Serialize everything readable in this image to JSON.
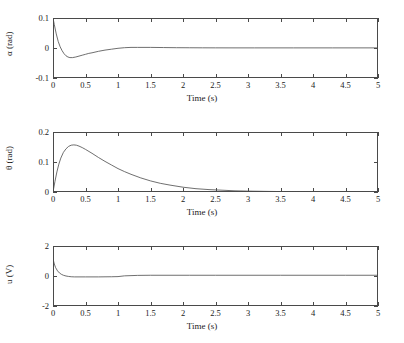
{
  "figure": {
    "background": "#ffffff",
    "line_color": "#4a4a4a",
    "axis_color": "#4a4a4a"
  },
  "chart_data": [
    {
      "type": "line",
      "name": "alpha-response",
      "title": "",
      "xlabel": "Time (s)",
      "ylabel": "α (rad)",
      "ylabel_symbol": "α",
      "ylabel_unit": "(rad)",
      "xlim": [
        0,
        5
      ],
      "ylim": [
        -0.1,
        0.1
      ],
      "xticks": [
        0,
        0.5,
        1,
        1.5,
        2,
        2.5,
        3,
        3.5,
        4,
        4.5,
        5
      ],
      "xticklabels": [
        "0",
        "0.5",
        "1",
        "1.5",
        "2",
        "2.5",
        "3",
        "3.5",
        "4",
        "4.5",
        "5"
      ],
      "yticks": [
        -0.1,
        0,
        0.1
      ],
      "yticklabels": [
        "-0.1",
        "0",
        "0.1"
      ],
      "grid": false,
      "legend": null,
      "x": [
        0,
        0.02,
        0.05,
        0.08,
        0.11,
        0.14,
        0.17,
        0.2,
        0.23,
        0.26,
        0.3,
        0.35,
        0.4,
        0.45,
        0.5,
        0.55,
        0.6,
        0.7,
        0.8,
        0.9,
        1.0,
        1.1,
        1.2,
        1.3,
        1.4,
        1.5,
        1.7,
        1.9,
        2.1,
        2.3,
        2.5,
        2.8,
        3.1,
        3.4,
        3.7,
        4.0,
        4.3,
        4.6,
        5.0
      ],
      "values": [
        0.1,
        0.078,
        0.047,
        0.022,
        0.004,
        -0.009,
        -0.019,
        -0.026,
        -0.03,
        -0.032,
        -0.032,
        -0.03,
        -0.027,
        -0.024,
        -0.021,
        -0.018,
        -0.016,
        -0.011,
        -0.007,
        -0.004,
        -0.001,
        0.001,
        0.002,
        0.002,
        0.002,
        0.002,
        0.0015,
        0.001,
        0.0008,
        0.0006,
        0.0005,
        0.0004,
        0.0004,
        0.0004,
        0.0004,
        0.0004,
        0.0004,
        0.0004,
        0.0004
      ]
    },
    {
      "type": "line",
      "name": "theta-response",
      "title": "",
      "xlabel": "Time (s)",
      "ylabel": "θ (rad)",
      "ylabel_symbol": "θ",
      "ylabel_unit": "(rad)",
      "xlim": [
        0,
        5
      ],
      "ylim": [
        0,
        0.2
      ],
      "xticks": [
        0,
        0.5,
        1,
        1.5,
        2,
        2.5,
        3,
        3.5,
        4,
        4.5,
        5
      ],
      "xticklabels": [
        "0",
        "0.5",
        "1",
        "1.5",
        "2",
        "2.5",
        "3",
        "3.5",
        "4",
        "4.5",
        "5"
      ],
      "yticks": [
        0,
        0.1,
        0.2
      ],
      "yticklabels": [
        "0",
        "0.1",
        "0.2"
      ],
      "grid": false,
      "legend": null,
      "x": [
        0,
        0.03,
        0.06,
        0.09,
        0.12,
        0.16,
        0.2,
        0.24,
        0.28,
        0.32,
        0.36,
        0.4,
        0.45,
        0.5,
        0.6,
        0.7,
        0.8,
        0.9,
        1.0,
        1.1,
        1.2,
        1.35,
        1.5,
        1.65,
        1.8,
        2.0,
        2.2,
        2.4,
        2.6,
        2.8,
        3.0,
        3.3,
        3.6,
        4.0,
        4.4,
        5.0
      ],
      "values": [
        0.0,
        0.035,
        0.067,
        0.093,
        0.113,
        0.132,
        0.144,
        0.152,
        0.156,
        0.157,
        0.156,
        0.153,
        0.148,
        0.142,
        0.129,
        0.115,
        0.102,
        0.09,
        0.078,
        0.068,
        0.059,
        0.047,
        0.037,
        0.029,
        0.023,
        0.016,
        0.011,
        0.008,
        0.006,
        0.004,
        0.003,
        0.002,
        0.0012,
        0.0007,
        0.0004,
        0.0002
      ]
    },
    {
      "type": "line",
      "name": "u-control-effort",
      "title": "",
      "xlabel": "Time (s)",
      "ylabel": "u (V)",
      "ylabel_symbol": "u",
      "ylabel_unit": "(V)",
      "xlim": [
        0,
        5
      ],
      "ylim": [
        -2,
        2
      ],
      "xticks": [
        0,
        0.5,
        1,
        1.5,
        2,
        2.5,
        3,
        3.5,
        4,
        4.5,
        5
      ],
      "xticklabels": [
        "0",
        "0.5",
        "1",
        "1.5",
        "2",
        "2.5",
        "3",
        "3.5",
        "4",
        "4.5",
        "5"
      ],
      "yticks": [
        -2,
        0,
        2
      ],
      "yticklabels": [
        "-2",
        "0",
        "2"
      ],
      "grid": false,
      "legend": null,
      "x": [
        0,
        0.02,
        0.04,
        0.07,
        0.1,
        0.13,
        0.16,
        0.2,
        0.24,
        0.28,
        0.33,
        0.4,
        0.5,
        0.6,
        0.7,
        0.8,
        0.9,
        1.0,
        1.1,
        1.3,
        1.5,
        1.8,
        2.1,
        2.5,
        3.0,
        3.5,
        4.0,
        4.5,
        5.0
      ],
      "values": [
        1.15,
        0.8,
        0.56,
        0.34,
        0.2,
        0.11,
        0.05,
        0.0,
        -0.03,
        -0.05,
        -0.06,
        -0.06,
        -0.06,
        -0.06,
        -0.06,
        -0.055,
        -0.05,
        -0.04,
        0.01,
        0.04,
        0.05,
        0.05,
        0.05,
        0.05,
        0.05,
        0.05,
        0.05,
        0.05,
        0.05
      ]
    }
  ]
}
